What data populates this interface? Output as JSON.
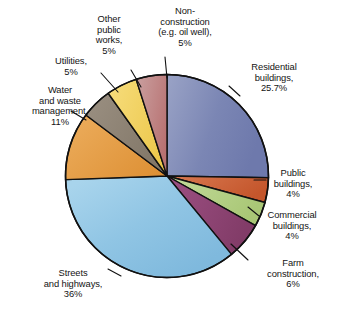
{
  "chart_data": {
    "type": "pie",
    "title": "",
    "xlabel": "",
    "ylabel": "",
    "legend_position": "none",
    "grid": false,
    "start_angle_deg": 0,
    "direction": "clockwise",
    "categories": [
      "Residential buildings",
      "Public buildings",
      "Commercial buildings",
      "Farm construction",
      "Streets and highways",
      "Water and waste management",
      "Utilities",
      "Other public works",
      "Non-construction (e.g. oil well)"
    ],
    "values": [
      25.7,
      4,
      4,
      6,
      36,
      11,
      5,
      5,
      5
    ],
    "value_unit": "%",
    "colors": [
      "#7b86b4",
      "#cc5f33",
      "#b4cf83",
      "#8e4472",
      "#8fc4e3",
      "#e39a40",
      "#8d8274",
      "#f2d05a",
      "#c08080"
    ],
    "slices": [
      {
        "label": "Residential buildings",
        "value": 25.7,
        "display": "25.7%",
        "color": "#7b86b4"
      },
      {
        "label": "Public buildings",
        "value": 4,
        "display": "4%",
        "color": "#cc5f33"
      },
      {
        "label": "Commercial buildings",
        "value": 4,
        "display": "4%",
        "color": "#b4cf83"
      },
      {
        "label": "Farm construction",
        "value": 6,
        "display": "6%",
        "color": "#8e4472"
      },
      {
        "label": "Streets and highways",
        "value": 36,
        "display": "36%",
        "color": "#8fc4e3"
      },
      {
        "label": "Water and waste management",
        "value": 11,
        "display": "11%",
        "color": "#e39a40"
      },
      {
        "label": "Utilities",
        "value": 5,
        "display": "5%",
        "color": "#8d8274"
      },
      {
        "label": "Other public works",
        "value": 5,
        "display": "5%",
        "color": "#f2d05a"
      },
      {
        "label": "Non-construction (e.g. oil well)",
        "value": 5,
        "display": "5%",
        "color": "#c08080"
      }
    ]
  },
  "labels": {
    "residential": "Residential\nbuildings,\n25.7%",
    "public_buildings": "Public\nbuildings,\n4%",
    "commercial_buildings": "Commercial\nbuildings,\n4%",
    "farm_construction": "Farm\nconstruction,\n6%",
    "streets_highways": "Streets\nand highways,\n36%",
    "water_waste": "Water\nand waste\nmanagement,\n11%",
    "utilities": "Utilities,\n5%",
    "other_public_works": "Other\npublic\nworks,\n5%",
    "non_construction": "Non-\nconstruction\n(e.g. oil well),\n5%"
  }
}
